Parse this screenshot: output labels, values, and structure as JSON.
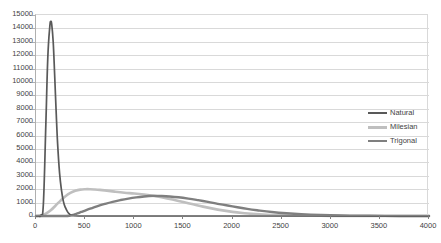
{
  "chart_data": {
    "type": "line",
    "title": "",
    "subtitle": "",
    "xlabel": "",
    "ylabel": "",
    "xlim": [
      0,
      4000
    ],
    "ylim": [
      0,
      15000
    ],
    "grid": true,
    "grid_axis": "y",
    "legend_position": "right-middle",
    "x_tick_labels": [
      "0",
      "500",
      "1000",
      "1500",
      "2000",
      "2500",
      "3000",
      "3500",
      "4000"
    ],
    "x_ticks": [
      0,
      500,
      1000,
      1500,
      2000,
      2500,
      3000,
      3500,
      4000
    ],
    "y_tick_labels": [
      "0",
      "1000",
      "2000",
      "3000",
      "4000",
      "5000",
      "6000",
      "7000",
      "8000",
      "9000",
      "10000",
      "11000",
      "12000",
      "13000",
      "14000",
      "15000"
    ],
    "y_ticks": [
      0,
      1000,
      2000,
      3000,
      4000,
      5000,
      6000,
      7000,
      8000,
      9000,
      10000,
      11000,
      12000,
      13000,
      14000,
      15000
    ],
    "series": [
      {
        "name": "Natural",
        "color": "#595959",
        "width": 1.7,
        "peak_x": 150,
        "peak_y": 14500,
        "x": [
          0,
          25,
          50,
          75,
          100,
          120,
          140,
          150,
          160,
          175,
          190,
          205,
          220,
          240,
          260,
          280,
          300,
          320,
          340,
          360,
          400,
          450,
          500,
          600,
          700,
          800,
          1000,
          1200,
          1500,
          2000,
          2500,
          3000,
          3500,
          4000
        ],
        "values": [
          0,
          10,
          60,
          900,
          6800,
          11800,
          14100,
          14500,
          14300,
          13000,
          10500,
          7800,
          5400,
          3200,
          1900,
          1050,
          620,
          330,
          150,
          60,
          20,
          8,
          4,
          2,
          1,
          0,
          0,
          0,
          0,
          0,
          0,
          0,
          0,
          0
        ]
      },
      {
        "name": "Milesian",
        "color": "#bfbfbf",
        "width": 2.6,
        "peak_x": 560,
        "peak_y": 2000,
        "x": [
          0,
          50,
          100,
          150,
          200,
          250,
          300,
          350,
          400,
          450,
          500,
          550,
          600,
          650,
          700,
          800,
          900,
          1000,
          1100,
          1200,
          1300,
          1400,
          1500,
          1600,
          1700,
          1800,
          1900,
          2000,
          2100,
          2200,
          2400,
          2600,
          2800,
          3000,
          3200,
          3500,
          4000
        ],
        "values": [
          0,
          40,
          180,
          430,
          780,
          1150,
          1480,
          1720,
          1880,
          1970,
          2000,
          2000,
          1980,
          1950,
          1910,
          1820,
          1740,
          1680,
          1600,
          1500,
          1370,
          1210,
          1040,
          870,
          700,
          550,
          420,
          310,
          225,
          160,
          80,
          40,
          20,
          10,
          5,
          2,
          0
        ]
      },
      {
        "name": "Trigonal",
        "color": "#7f7f7f",
        "width": 2.4,
        "peak_x": 1150,
        "peak_y": 1500,
        "x": [
          0,
          100,
          200,
          300,
          340,
          380,
          420,
          460,
          500,
          560,
          620,
          700,
          780,
          860,
          940,
          1020,
          1100,
          1150,
          1200,
          1280,
          1360,
          1450,
          1550,
          1650,
          1750,
          1850,
          1950,
          2050,
          2150,
          2250,
          2400,
          2550,
          2700,
          2900,
          3100,
          3400,
          3700,
          4000
        ],
        "values": [
          0,
          0,
          0,
          0,
          20,
          90,
          190,
          300,
          410,
          570,
          720,
          900,
          1060,
          1190,
          1300,
          1390,
          1460,
          1490,
          1500,
          1490,
          1460,
          1400,
          1300,
          1180,
          1050,
          910,
          780,
          650,
          530,
          430,
          300,
          205,
          135,
          75,
          40,
          14,
          5,
          0
        ]
      }
    ]
  },
  "legend": {
    "items": [
      {
        "label": "Natural"
      },
      {
        "label": "Milesian"
      },
      {
        "label": "Trigonal"
      }
    ]
  },
  "colors": {
    "natural": "#595959",
    "milesian": "#bfbfbf",
    "trigonal": "#7f7f7f",
    "gridline": "#d9d9d9",
    "axis": "#808080",
    "text": "#3f3f3f",
    "background": "#ffffff"
  }
}
